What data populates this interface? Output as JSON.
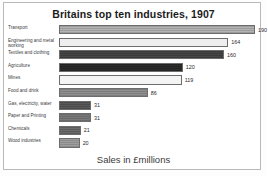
{
  "chart_data": {
    "type": "bar",
    "orientation": "horizontal",
    "title": "Britains top ten industries, 1907",
    "xlabel": "Sales in £millions",
    "ylabel": "",
    "grid": false,
    "legend": "none",
    "xlim": [
      0,
      190
    ],
    "categories": [
      "Transport",
      "Engineering and metal working",
      "Textiles and clothing",
      "Agriculture",
      "Mines",
      "Food and drink",
      "Gas, electricity, water",
      "Paper and Printing",
      "Chemicals",
      "Wood industries"
    ],
    "values": [
      190,
      164,
      160,
      120,
      119,
      86,
      31,
      31,
      21,
      20
    ],
    "value_labels": [
      "190",
      "164",
      "160",
      "120",
      "119",
      "86",
      "31",
      "31",
      "21",
      "20"
    ],
    "bar_fills": [
      "medium-gray-hatch",
      "near-white",
      "dark-gray-hatch",
      "very-dark-hatch",
      "white",
      "gray-hatch",
      "dark-gray",
      "mid-gray",
      "dark-mid-gray",
      "light-gray-hatch"
    ]
  },
  "chart": {
    "title": "Britains top ten industries, 1907",
    "axis_title": "Sales in £millions"
  }
}
